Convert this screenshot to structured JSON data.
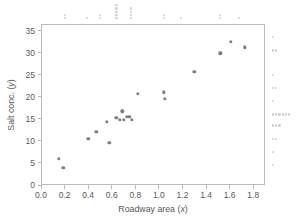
{
  "chart_data": {
    "type": "scatter",
    "title": "",
    "xlabel": "Roadway area (x)",
    "ylabel": "Salt conc. (y)",
    "xlabel_text": "Roadway area (",
    "xlabel_var": "x",
    "ylabel_text": "Salt conc. (",
    "ylabel_var": "y",
    "xlim": [
      0.0,
      1.9
    ],
    "ylim": [
      0,
      36.5
    ],
    "xticks": [
      0.0,
      0.2,
      0.4,
      0.6,
      0.8,
      1.0,
      1.2,
      1.4,
      1.6,
      1.8
    ],
    "yticks": [
      0,
      5,
      10,
      15,
      20,
      25,
      30,
      35
    ],
    "xtick_labels": [
      "0.0",
      "0.2",
      "0.4",
      "0.6",
      "0.8",
      "1.0",
      "1.2",
      "1.4",
      "1.6",
      "1.8"
    ],
    "ytick_labels": [
      "0",
      "5",
      "10",
      "15",
      "20",
      "25",
      "30",
      "35"
    ],
    "grid": false,
    "legend": false,
    "marker_color": "#7d7d7d",
    "rug_color": "#d0d0d0",
    "frame_color": "#b9b9b9",
    "text_color": "#58585a",
    "points": [
      {
        "x": 0.15,
        "y": 6.0
      },
      {
        "x": 0.19,
        "y": 3.9
      },
      {
        "x": 0.4,
        "y": 10.5
      },
      {
        "x": 0.47,
        "y": 12.1
      },
      {
        "x": 0.56,
        "y": 14.3
      },
      {
        "x": 0.58,
        "y": 9.5
      },
      {
        "x": 0.64,
        "y": 15.2
      },
      {
        "x": 0.67,
        "y": 14.8
      },
      {
        "x": 0.69,
        "y": 16.7
      },
      {
        "x": 0.7,
        "y": 14.8
      },
      {
        "x": 0.73,
        "y": 15.4
      },
      {
        "x": 0.75,
        "y": 15.4
      },
      {
        "x": 0.77,
        "y": 14.8
      },
      {
        "x": 0.82,
        "y": 20.7
      },
      {
        "x": 1.04,
        "y": 21.0
      },
      {
        "x": 1.05,
        "y": 19.6
      },
      {
        "x": 1.3,
        "y": 25.7
      },
      {
        "x": 1.52,
        "y": 29.9
      },
      {
        "x": 1.61,
        "y": 32.5
      },
      {
        "x": 1.73,
        "y": 31.2
      }
    ],
    "x_marginal_dotplot": {
      "description": "Top marginal dot plot of roadway area distribution",
      "columns": [
        {
          "x": 0.2,
          "count": 2
        },
        {
          "x": 0.39,
          "count": 1
        },
        {
          "x": 0.5,
          "count": 2
        },
        {
          "x": 0.64,
          "count": 5
        },
        {
          "x": 0.76,
          "count": 4
        },
        {
          "x": 1.04,
          "count": 2
        },
        {
          "x": 1.19,
          "count": 1
        },
        {
          "x": 1.52,
          "count": 2
        },
        {
          "x": 1.68,
          "count": 1
        }
      ]
    },
    "y_marginal_dotplot": {
      "description": "Right marginal dot plot of salt concentration distribution",
      "rows": [
        {
          "y": 33.5,
          "count": 1
        },
        {
          "y": 30.5,
          "count": 2
        },
        {
          "y": 25.0,
          "count": 1
        },
        {
          "y": 22.0,
          "count": 2
        },
        {
          "y": 19.0,
          "count": 1
        },
        {
          "y": 16.0,
          "count": 6
        },
        {
          "y": 13.5,
          "count": 3
        },
        {
          "y": 10.5,
          "count": 2
        },
        {
          "y": 7.5,
          "count": 1
        },
        {
          "y": 4.5,
          "count": 1
        }
      ]
    }
  },
  "figure": {
    "width": 301,
    "height": 220,
    "background": "#ffffff"
  }
}
